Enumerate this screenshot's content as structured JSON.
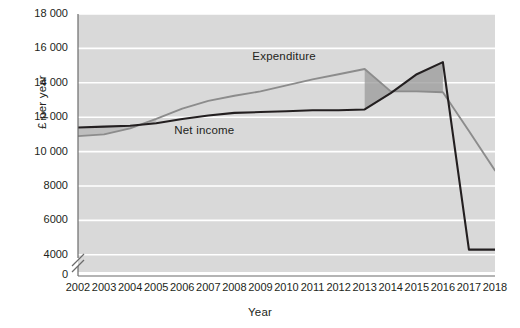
{
  "chart_data": {
    "type": "line",
    "title": "",
    "xlabel": "Year",
    "ylabel": "£ per year",
    "x": [
      2002,
      2003,
      2004,
      2005,
      2006,
      2007,
      2008,
      2009,
      2010,
      2011,
      2012,
      2013,
      2014,
      2015,
      2016,
      2017,
      2018
    ],
    "xlim": [
      2002,
      2018
    ],
    "ylim": [
      3000,
      18000
    ],
    "y_axis_break": true,
    "y_break_label": "0",
    "yticks": [
      4000,
      6000,
      8000,
      10000,
      12000,
      14000,
      16000,
      18000
    ],
    "ytick_labels": [
      "4000",
      "6000",
      "8000",
      "10 000",
      "12 000",
      "14 000",
      "16 000",
      "18 000"
    ],
    "xtick_labels": [
      "2002",
      "2003",
      "2004",
      "2005",
      "2006",
      "2007",
      "2008",
      "2009",
      "2010",
      "2011",
      "2012",
      "2013",
      "2014",
      "2015",
      "2016",
      "2017",
      "2018"
    ],
    "grid": "horizontal",
    "legend": "inline-labels",
    "series": [
      {
        "name": "Net income",
        "color": "#231f20",
        "label_x": 2006.0,
        "label_y": 11150,
        "values": [
          11400,
          11450,
          11500,
          11650,
          11900,
          12100,
          12250,
          12300,
          12350,
          12400,
          12400,
          12450,
          13400,
          14500,
          15200,
          4300,
          4300
        ]
      },
      {
        "name": "Expenditure",
        "color": "#8c8c8c",
        "label_x": 2010.3,
        "label_y": 15450,
        "values": [
          10900,
          11000,
          11350,
          11900,
          12500,
          12950,
          13250,
          13500,
          13850,
          14200,
          14500,
          14800,
          13500,
          13500,
          13450,
          11200,
          8900
        ]
      }
    ],
    "shaded_regions": [
      {
        "name": "deficit-band",
        "from": 2002,
        "to": 2005,
        "fill": "#a8a8a8",
        "opacity": 0.55
      },
      {
        "name": "surplus-band",
        "from": 2013,
        "to": 2016,
        "fill": "#9a9a9a",
        "opacity": 0.75
      }
    ],
    "plot_background": "#d9d9d9",
    "gridline_color": "#ffffff"
  },
  "labels": {
    "net_income": "Net income",
    "expenditure": "Expenditure",
    "xlabel": "Year",
    "ylabel": "£ per year"
  }
}
